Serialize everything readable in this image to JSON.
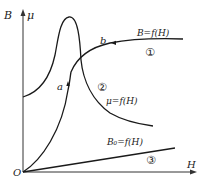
{
  "diagram": {
    "axes": {
      "y_label_left": "B",
      "y_label_right": "μ",
      "x_label": "H",
      "origin_label": "O"
    },
    "curves": [
      {
        "id": "1",
        "label": "B=f(H)",
        "marker": "①"
      },
      {
        "id": "2",
        "label": "μ=f(H)",
        "marker": "②"
      },
      {
        "id": "3",
        "label": "B₀=f(H)",
        "marker": "③"
      }
    ],
    "points": {
      "a": "a",
      "b": "b"
    }
  }
}
